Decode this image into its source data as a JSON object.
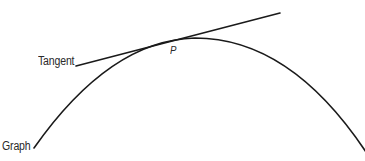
{
  "diagram": {
    "title": "",
    "labels": {
      "tangent": "Tangent",
      "graph": "Graph",
      "point": "P"
    },
    "colors": {
      "stroke": "#1a1a1a",
      "text": "#2a2a2a",
      "background": "#ffffff"
    },
    "elements": [
      {
        "type": "curve",
        "name": "graph",
        "shape": "downward parabola",
        "from": [
          34,
          148
        ],
        "peak": [
          195,
          38
        ],
        "to": [
          365,
          150
        ]
      },
      {
        "type": "line",
        "name": "tangent",
        "from": [
          76,
          66
        ],
        "to": [
          280,
          13
        ],
        "touches_at": "P"
      },
      {
        "type": "point",
        "name": "P",
        "at": [
          172,
          40
        ]
      }
    ]
  }
}
